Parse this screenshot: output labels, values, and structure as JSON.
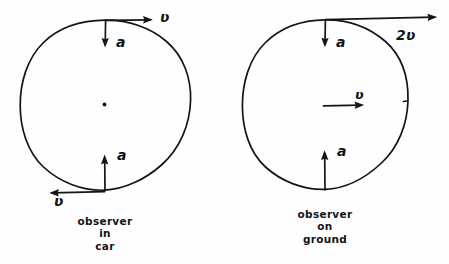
{
  "figure": {
    "type": "hand-drawn physics diagram",
    "background_color": "#fefefe",
    "ink_color": "#151515"
  },
  "panels": [
    {
      "id": "left-panel",
      "frame": "car",
      "caption_lines": [
        "observer",
        "in",
        "car"
      ],
      "wheel": {
        "center_x": 105,
        "center_y": 105,
        "radius": 85,
        "has_center_dot": true
      },
      "vectors": [
        {
          "name": "top-velocity",
          "label": "ʋ",
          "direction": "right",
          "anchor": "top of wheel",
          "magnitude_text": "v"
        },
        {
          "name": "top-acceleration",
          "label": "a",
          "direction": "down",
          "anchor": "top of wheel",
          "magnitude_text": "a"
        },
        {
          "name": "bottom-acceleration",
          "label": "a",
          "direction": "up",
          "anchor": "bottom of wheel",
          "magnitude_text": "a"
        },
        {
          "name": "bottom-velocity",
          "label": "ʋ",
          "direction": "left",
          "anchor": "bottom of wheel",
          "magnitude_text": "v"
        }
      ]
    },
    {
      "id": "right-panel",
      "frame": "ground",
      "caption_lines": [
        "observer",
        "on",
        "ground"
      ],
      "wheel": {
        "center_x": 325,
        "center_y": 105,
        "radius": 83,
        "has_center_dot": false
      },
      "vectors": [
        {
          "name": "top-velocity",
          "label": "2ʋ",
          "direction": "right",
          "anchor": "top of wheel",
          "magnitude_text": "2v"
        },
        {
          "name": "top-acceleration",
          "label": "a",
          "direction": "down",
          "anchor": "top of wheel",
          "magnitude_text": "a"
        },
        {
          "name": "center-velocity",
          "label": "ʋ",
          "direction": "right",
          "anchor": "center of wheel",
          "magnitude_text": "v"
        },
        {
          "name": "bottom-acceleration",
          "label": "a",
          "direction": "up",
          "anchor": "bottom of wheel",
          "magnitude_text": "a"
        }
      ]
    }
  ],
  "labels": {
    "left_top_velocity": "ʋ",
    "left_top_accel": "a",
    "left_bottom_accel": "a",
    "left_bottom_velocity": "ʋ",
    "left_caption_1": "observer",
    "left_caption_2": "in",
    "left_caption_3": "car",
    "right_top_velocity": "2ʋ",
    "right_top_accel": "a",
    "right_center_velocity": "ʋ",
    "right_bottom_accel": "a",
    "right_caption_1": "observer",
    "right_caption_2": "on",
    "right_caption_3": "ground"
  }
}
